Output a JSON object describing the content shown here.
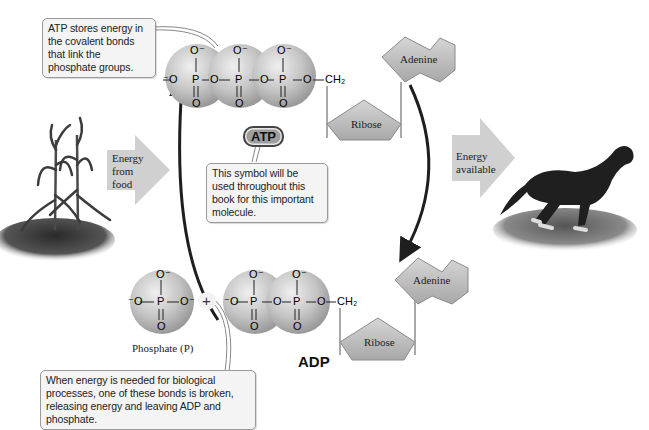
{
  "diagram": {
    "callouts": {
      "atp_bonds": "ATP stores energy in the covalent bonds that link the phosphate groups.",
      "atp_symbol": "This symbol will be used throughout this book for this important molecule.",
      "hydrolysis": "When energy is needed for biological processes, one of these bonds is broken, releasing energy and leaving ADP and phosphate."
    },
    "arrows": {
      "energy_in": "Energy from food",
      "energy_out": "Energy available"
    },
    "atp": {
      "badge": "ATP",
      "formula": {
        "o_minus": "O⁻",
        "o_left": "⁻O",
        "p": "P",
        "o": "O",
        "ch2": "CH₂"
      },
      "ribose": "Ribose",
      "adenine": "Adenine"
    },
    "adp": {
      "label": "ADP",
      "ribose": "Ribose",
      "adenine": "Adenine"
    },
    "phosphate": {
      "caption": "Phosphate (P)",
      "plus": "+"
    },
    "images": {
      "left": "corn-plant",
      "right": "running-horse"
    },
    "colors": {
      "sphere": "#bdbdbd",
      "pentagon": "#b8b8b8",
      "big_arrow": "#cfcfcf",
      "cycle_arrow": "#1e1e1e",
      "callout_bg": "#f4f4f4"
    }
  }
}
